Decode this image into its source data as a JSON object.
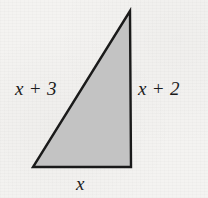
{
  "figure": {
    "kind": "right-triangle-diagram",
    "background_color": "#f4f3f1",
    "fill_color": "#c3c3c3",
    "stroke_color": "#1a1a1a",
    "stroke_width": 2.4,
    "vertices": {
      "apex": {
        "x": 130,
        "y": 11
      },
      "bottom_left": {
        "x": 33,
        "y": 167
      },
      "bottom_right": {
        "x": 131,
        "y": 167
      }
    },
    "polygon_points": "130,11 131,167 33,167",
    "labels": {
      "hypotenuse": "x + 3",
      "right_leg": "x + 2",
      "bottom_leg": "x"
    }
  }
}
